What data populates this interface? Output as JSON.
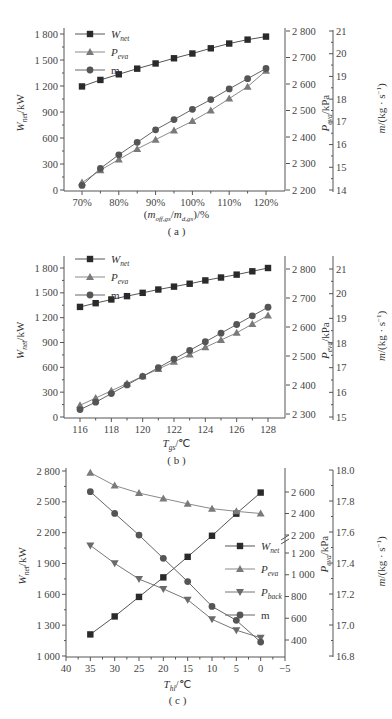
{
  "chart_data": [
    {
      "id": "a",
      "type": "line",
      "caption": "( a )",
      "xlabel": "(m_off,gs/m_d,gs)/%",
      "x": [
        "70%",
        "75%",
        "80%",
        "85%",
        "90%",
        "95%",
        "100%",
        "105%",
        "110%",
        "115%",
        "120%"
      ],
      "x_ticks": [
        "70%",
        "80%",
        "90%",
        "100%",
        "110%",
        "120%"
      ],
      "y_left": {
        "label": "W_net/kW",
        "range": [
          0,
          1800
        ],
        "ticks": [
          "0",
          "300",
          "600",
          "900",
          "1 200",
          "1 500",
          "1 800"
        ]
      },
      "y_right1": {
        "label": "P_eva/kPa",
        "range": [
          2200,
          2800
        ],
        "ticks": [
          "2 200",
          "2 300",
          "2 400",
          "2 500",
          "2 600",
          "2 700",
          "2 800"
        ]
      },
      "y_right2": {
        "label": "m/(kg·s⁻¹)",
        "range": [
          14,
          21
        ],
        "ticks": [
          "14",
          "15",
          "16",
          "17",
          "18",
          "19",
          "20",
          "21"
        ]
      },
      "legend": [
        "W_net",
        "P_eva",
        "m"
      ],
      "series": [
        {
          "name": "W_net",
          "axis": "left",
          "marker": "square",
          "values": [
            1195,
            1270,
            1335,
            1400,
            1460,
            1520,
            1575,
            1635,
            1690,
            1735,
            1770
          ]
        },
        {
          "name": "P_eva",
          "axis": "right1",
          "marker": "triangle",
          "values": [
            2228,
            2275,
            2315,
            2355,
            2390,
            2425,
            2460,
            2500,
            2545,
            2590,
            2650
          ]
        },
        {
          "name": "m",
          "axis": "right2",
          "marker": "circle",
          "values": [
            14.2,
            14.95,
            15.55,
            16.1,
            16.65,
            17.1,
            17.55,
            17.98,
            18.45,
            18.9,
            19.35
          ]
        }
      ]
    },
    {
      "id": "b",
      "type": "line",
      "caption": "( b )",
      "xlabel": "T_gs/℃",
      "x": [
        116,
        117,
        118,
        119,
        120,
        121,
        122,
        123,
        124,
        125,
        126,
        127,
        128
      ],
      "x_ticks": [
        "116",
        "118",
        "120",
        "122",
        "124",
        "126",
        "128"
      ],
      "y_left": {
        "label": "W_net/kW",
        "range": [
          0,
          1800
        ],
        "ticks": [
          "0",
          "300",
          "600",
          "900",
          "1 200",
          "1 500",
          "1 800"
        ]
      },
      "y_right1": {
        "label": "P_eva/kPa",
        "range": [
          2300,
          2800
        ],
        "ticks": [
          "2 300",
          "2 400",
          "2 500",
          "2 600",
          "2 700",
          "2 800"
        ]
      },
      "y_right2": {
        "label": "m/(kg·s⁻¹)",
        "range": [
          15,
          21
        ],
        "ticks": [
          "15",
          "16",
          "17",
          "18",
          "19",
          "20",
          "21"
        ]
      },
      "legend": [
        "W_net",
        "P_eva",
        "m"
      ],
      "series": [
        {
          "name": "W_net",
          "axis": "left",
          "marker": "square",
          "values": [
            1330,
            1375,
            1420,
            1460,
            1500,
            1540,
            1575,
            1610,
            1650,
            1685,
            1720,
            1760,
            1800
          ]
        },
        {
          "name": "P_eva",
          "axis": "right1",
          "marker": "triangle",
          "values": [
            2330,
            2355,
            2380,
            2405,
            2430,
            2455,
            2480,
            2505,
            2530,
            2555,
            2580,
            2610,
            2640
          ]
        },
        {
          "name": "m",
          "axis": "right2",
          "marker": "circle",
          "values": [
            15.3,
            15.6,
            15.95,
            16.3,
            16.65,
            17.0,
            17.35,
            17.7,
            18.05,
            18.4,
            18.75,
            19.1,
            19.45
          ]
        }
      ]
    },
    {
      "id": "c",
      "type": "line",
      "caption": "( c )",
      "xlabel": "T_hl/℃",
      "x": [
        35,
        30,
        25,
        20,
        15,
        10,
        5,
        0
      ],
      "x_ticks": [
        "40",
        "35",
        "30",
        "25",
        "20",
        "15",
        "10",
        "5",
        "0",
        "−5"
      ],
      "y_left": {
        "label": "W_net/kW",
        "range": [
          1000,
          2800
        ],
        "ticks": [
          "1 000",
          "1 300",
          "1 600",
          "1 900",
          "2 200",
          "2 500",
          "2 800"
        ]
      },
      "y_right1": {
        "label": "P_eva/kPa",
        "range": [
          400,
          2600
        ],
        "ticks": [
          "400",
          "600",
          "800",
          "1 000",
          "1 200",
          "2 200",
          "2 400",
          "2 600"
        ],
        "axis_break": "between 1 200 and 2 200"
      },
      "y_right2": {
        "label": "m/(kg·s⁻¹)",
        "range": [
          16.8,
          18.0
        ],
        "ticks": [
          "16.8",
          "17.0",
          "17.2",
          "17.4",
          "17.6",
          "17.8",
          "18.0"
        ]
      },
      "legend": [
        "W_net",
        "P_eva",
        "P_back",
        "m"
      ],
      "series": [
        {
          "name": "W_net",
          "axis": "left",
          "marker": "square",
          "values": [
            1210,
            1385,
            1575,
            1765,
            1965,
            2170,
            2385,
            2590
          ]
        },
        {
          "name": "P_eva",
          "axis": "right1",
          "marker": "triangle",
          "values": [
            2780,
            2660,
            2590,
            2540,
            2490,
            2445,
            2420,
            2400
          ]
        },
        {
          "name": "P_back",
          "axis": "right1",
          "marker": "inverted-triangle",
          "values": [
            1270,
            1105,
            960,
            870,
            770,
            590,
            490,
            420
          ]
        },
        {
          "name": "m",
          "axis": "right2",
          "marker": "circle",
          "values": [
            17.86,
            17.72,
            17.58,
            17.43,
            17.28,
            17.12,
            17.03,
            16.89
          ]
        }
      ]
    }
  ]
}
